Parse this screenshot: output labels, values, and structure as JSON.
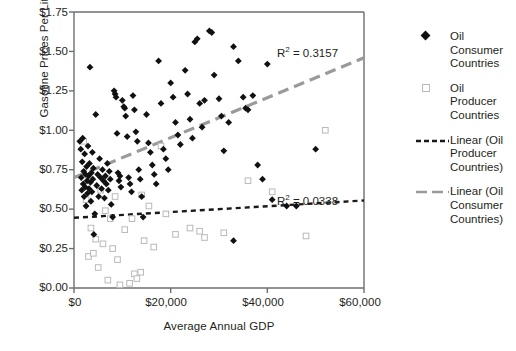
{
  "chart_data": {
    "type": "scatter",
    "title": "",
    "xlabel": "Average Annual GDP",
    "ylabel": "Gasoline Prices Per Liter 2004",
    "xlim": [
      0,
      60000
    ],
    "ylim": [
      0,
      1.75
    ],
    "xticks": [
      "$0",
      "$20,000",
      "$40,000",
      "$60,000"
    ],
    "xtick_values": [
      0,
      20000,
      40000,
      60000
    ],
    "yticks": [
      "$0.00",
      "$0.25",
      "$0.50",
      "$0.75",
      "$1.00",
      "$1.25",
      "$1.50",
      "$1.75"
    ],
    "ytick_values": [
      0,
      0.25,
      0.5,
      0.75,
      1.0,
      1.25,
      1.5,
      1.75
    ],
    "grid": false,
    "legend_position": "right",
    "series": [
      {
        "name": "Oil Consumer Countries",
        "marker": "filled-diamond",
        "color": "#111111",
        "points": [
          [
            1200,
            0.93
          ],
          [
            1400,
            0.88
          ],
          [
            1500,
            0.7
          ],
          [
            1600,
            0.62
          ],
          [
            1700,
            0.8
          ],
          [
            1800,
            0.95
          ],
          [
            1900,
            0.66
          ],
          [
            2000,
            0.74
          ],
          [
            2100,
            0.58
          ],
          [
            2200,
            0.85
          ],
          [
            2300,
            0.64
          ],
          [
            2400,
            0.72
          ],
          [
            2500,
            0.52
          ],
          [
            2600,
            0.77
          ],
          [
            2700,
            0.68
          ],
          [
            2800,
            0.6
          ],
          [
            2900,
            0.9
          ],
          [
            3000,
            0.71
          ],
          [
            3100,
            0.63
          ],
          [
            3200,
            0.79
          ],
          [
            3300,
            1.4
          ],
          [
            3400,
            0.67
          ],
          [
            3500,
            0.55
          ],
          [
            3600,
            0.73
          ],
          [
            3700,
            0.61
          ],
          [
            3800,
            0.86
          ],
          [
            3900,
            0.69
          ],
          [
            4000,
            0.76
          ],
          [
            4100,
            0.34
          ],
          [
            4300,
            0.47
          ],
          [
            4500,
            1.1
          ],
          [
            4700,
            0.65
          ],
          [
            4900,
            0.72
          ],
          [
            5100,
            0.58
          ],
          [
            5300,
            0.82
          ],
          [
            5500,
            0.7
          ],
          [
            5700,
            0.63
          ],
          [
            5900,
            0.75
          ],
          [
            6100,
            0.68
          ],
          [
            6300,
            0.57
          ],
          [
            6500,
            0.71
          ],
          [
            6700,
            0.66
          ],
          [
            6900,
            0.79
          ],
          [
            7100,
            0.62
          ],
          [
            7300,
            0.74
          ],
          [
            7500,
            0.69
          ],
          [
            7700,
            0.53
          ],
          [
            8000,
            0.45
          ],
          [
            8300,
            1.25
          ],
          [
            8500,
            1.23
          ],
          [
            8700,
            1.21
          ],
          [
            8900,
            0.98
          ],
          [
            9100,
            0.73
          ],
          [
            9300,
            0.68
          ],
          [
            9500,
            0.71
          ],
          [
            9700,
            0.64
          ],
          [
            10000,
            1.19
          ],
          [
            10300,
            1.15
          ],
          [
            10500,
            1.14
          ],
          [
            10700,
            1.09
          ],
          [
            11000,
            0.96
          ],
          [
            11300,
            0.7
          ],
          [
            11600,
            0.66
          ],
          [
            11900,
            0.61
          ],
          [
            12200,
            1.22
          ],
          [
            12500,
            1.13
          ],
          [
            12800,
            0.99
          ],
          [
            13100,
            0.93
          ],
          [
            13400,
            0.75
          ],
          [
            13700,
            0.69
          ],
          [
            14000,
            0.58
          ],
          [
            14300,
            0.45
          ],
          [
            15000,
            1.1
          ],
          [
            15400,
            0.92
          ],
          [
            15800,
            0.86
          ],
          [
            16200,
            0.78
          ],
          [
            16600,
            0.72
          ],
          [
            17000,
            0.66
          ],
          [
            17500,
            1.44
          ],
          [
            18000,
            1.17
          ],
          [
            18500,
            0.88
          ],
          [
            19000,
            0.82
          ],
          [
            19500,
            0.75
          ],
          [
            20000,
            1.3
          ],
          [
            20500,
            1.21
          ],
          [
            21000,
            1.05
          ],
          [
            21500,
            0.97
          ],
          [
            22000,
            0.91
          ],
          [
            23000,
            1.38
          ],
          [
            23500,
            1.23
          ],
          [
            24000,
            1.07
          ],
          [
            24500,
            0.95
          ],
          [
            25000,
            1.56
          ],
          [
            25500,
            1.58
          ],
          [
            26000,
            1.17
          ],
          [
            26500,
            1.02
          ],
          [
            27000,
            1.19
          ],
          [
            28000,
            1.63
          ],
          [
            28500,
            1.62
          ],
          [
            29000,
            1.35
          ],
          [
            30000,
            1.2
          ],
          [
            30500,
            1.09
          ],
          [
            31000,
            0.87
          ],
          [
            32000,
            1.05
          ],
          [
            33000,
            1.53
          ],
          [
            34000,
            1.44
          ],
          [
            35000,
            1.21
          ],
          [
            35500,
            1.14
          ],
          [
            36000,
            1.13
          ],
          [
            37000,
            1.22
          ],
          [
            38000,
            0.78
          ],
          [
            39000,
            0.69
          ],
          [
            40000,
            1.42
          ],
          [
            41000,
            0.56
          ],
          [
            44000,
            0.52
          ],
          [
            50000,
            0.88
          ],
          [
            33000,
            0.3
          ],
          [
            46000,
            0.52
          ]
        ]
      },
      {
        "name": "Oil Producer Countries",
        "marker": "open-square",
        "color": "#b9b9b9",
        "points": [
          [
            2000,
            0.93
          ],
          [
            2500,
            0.56
          ],
          [
            3000,
            0.2
          ],
          [
            3500,
            0.38
          ],
          [
            4000,
            0.22
          ],
          [
            4500,
            0.31
          ],
          [
            5000,
            0.13
          ],
          [
            5500,
            0.62
          ],
          [
            6000,
            0.28
          ],
          [
            6500,
            0.49
          ],
          [
            7000,
            0.05
          ],
          [
            7500,
            0.44
          ],
          [
            8000,
            0.25
          ],
          [
            8500,
            0.58
          ],
          [
            9000,
            0.18
          ],
          [
            9500,
            0.02
          ],
          [
            10500,
            0.37
          ],
          [
            11500,
            0.03
          ],
          [
            12500,
            0.09
          ],
          [
            13000,
            0.06
          ],
          [
            13800,
            0.1
          ],
          [
            14500,
            0.3
          ],
          [
            15500,
            0.52
          ],
          [
            16500,
            0.26
          ],
          [
            18000,
            0.9
          ],
          [
            19000,
            0.47
          ],
          [
            21000,
            0.34
          ],
          [
            24000,
            0.38
          ],
          [
            26000,
            0.36
          ],
          [
            27000,
            0.32
          ],
          [
            31000,
            0.35
          ],
          [
            36000,
            0.68
          ],
          [
            41000,
            0.61
          ],
          [
            48000,
            0.33
          ],
          [
            52000,
            1.0
          ],
          [
            14000,
            0.59
          ],
          [
            12000,
            0.44
          ]
        ]
      }
    ],
    "trendlines": [
      {
        "name": "Linear (Oil Consumer Countries)",
        "style": "dashed-long",
        "color": "#9a9a9a",
        "r_squared_label": "R2 = 0.3157",
        "r_squared": 0.3157,
        "x_start": 0,
        "y_start": 0.7,
        "x_end": 60000,
        "y_end": 1.46
      },
      {
        "name": "Linear (Oil Producer Countries)",
        "style": "dashed-short",
        "color": "#1a1a1a",
        "r_squared_label": "R2 = 0.0338",
        "r_squared": 0.0338,
        "x_start": 0,
        "y_start": 0.445,
        "x_end": 60000,
        "y_end": 0.555
      }
    ]
  },
  "legend": {
    "items": [
      {
        "marker": "filled-diamond",
        "label": "Oil\nConsumer\nCountries"
      },
      {
        "marker": "open-square",
        "label": "Oil\nProducer\nCountries"
      },
      {
        "marker": "dashed-short-line",
        "label": "Linear (Oil\nProducer\nCountries)"
      },
      {
        "marker": "dashed-long-line",
        "label": "Linear (Oil\nConsumer\nCountries)"
      }
    ],
    "item0_line1": "Oil",
    "item0_line2": "Consumer",
    "item0_line3": "Countries",
    "item1_line1": "Oil",
    "item1_line2": "Producer",
    "item1_line3": "Countries",
    "item2_line1": "Linear (Oil",
    "item2_line2": "Producer",
    "item2_line3": "Countries)",
    "item3_line1": "Linear (Oil",
    "item3_line2": "Consumer",
    "item3_line3": "Countries)"
  },
  "annotations": {
    "rsq_consumer_prefix": "R",
    "rsq_consumer_sup": "2",
    "rsq_consumer_value": " = 0.3157",
    "rsq_producer_prefix": "R",
    "rsq_producer_sup": "2",
    "rsq_producer_value": " = 0.0338"
  },
  "colors": {
    "marker_consumer": "#111111",
    "marker_producer": "#b9b9b9",
    "trend_consumer": "#9a9a9a",
    "trend_producer": "#1a1a1a",
    "axis": "#6d6e71",
    "text": "#231f20"
  }
}
